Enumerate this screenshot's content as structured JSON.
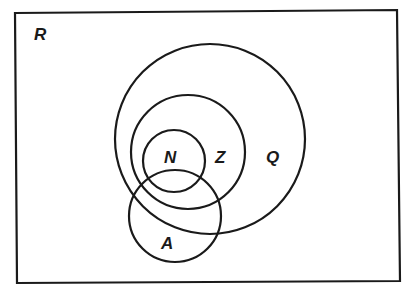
{
  "diagram": {
    "type": "venn",
    "universe": {
      "label": "R"
    },
    "sets": [
      {
        "id": "Q",
        "label": "Q",
        "contains": [
          "Z",
          "N"
        ]
      },
      {
        "id": "Z",
        "label": "Z",
        "contains": [
          "N"
        ]
      },
      {
        "id": "N",
        "label": "N"
      },
      {
        "id": "A",
        "label": "A",
        "overlaps": [
          "N",
          "Z",
          "Q"
        ]
      }
    ],
    "colors": {
      "stroke": "#1a1a1a",
      "background": "#ffffff"
    }
  }
}
